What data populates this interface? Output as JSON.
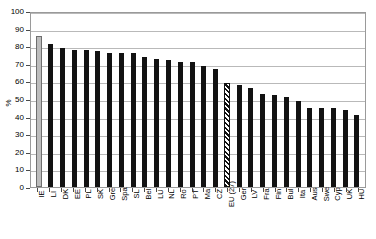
{
  "chart_data": {
    "type": "bar",
    "title": "",
    "xlabel": "",
    "ylabel": "%",
    "ylim": [
      0,
      100
    ],
    "ytick_step": 10,
    "yticks": [
      100,
      90,
      80,
      70,
      60,
      50,
      40,
      30,
      20,
      10,
      0
    ],
    "grid": true,
    "legend": "none",
    "categories": [
      "IE",
      "LI",
      "DK",
      "EE",
      "PL",
      "SK",
      "Gre",
      "Spa",
      "SL",
      "Bel",
      "LU",
      "NL",
      "Ro",
      "PT",
      "Ma",
      "CZ",
      "EU (27)",
      "Ger",
      "LV",
      "Fra",
      "Fin",
      "Bul",
      "Ita",
      "Aus",
      "Swe",
      "Cyp",
      "UK",
      "HU"
    ],
    "values": [
      86,
      81,
      79,
      78,
      78,
      77,
      76,
      76,
      76,
      74,
      73,
      72,
      71,
      71,
      69,
      67,
      59,
      58,
      56,
      53,
      52,
      51,
      49,
      45,
      45,
      45,
      44,
      41
    ],
    "bar_styles": [
      "grey",
      "solid",
      "solid",
      "solid",
      "solid",
      "solid",
      "solid",
      "solid",
      "solid",
      "solid",
      "solid",
      "solid",
      "solid",
      "solid",
      "solid",
      "solid",
      "hatched",
      "solid",
      "solid",
      "solid",
      "solid",
      "solid",
      "solid",
      "solid",
      "solid",
      "solid",
      "solid",
      "solid"
    ],
    "colors": {
      "bar_solid": "#121212",
      "bar_highlight": "#bdbdbd",
      "bar_hatched": "#111111",
      "gridline": "#b9b9b9",
      "frame": "#9a9a9a",
      "background": "#ffffff"
    }
  }
}
